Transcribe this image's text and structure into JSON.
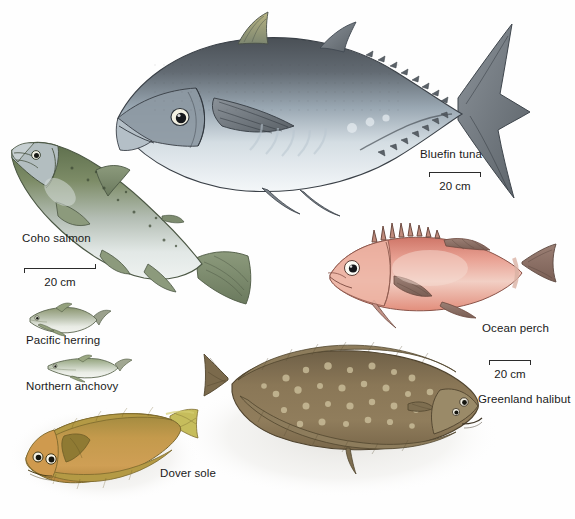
{
  "plate": {
    "title": "Marine fish species illustration plate",
    "background_color": "#fefefe",
    "width": 575,
    "height": 519
  },
  "species": [
    {
      "id": "bluefin-tuna",
      "label": "Bluefin tuna",
      "body_form": "fusiform",
      "colors": {
        "dorsal": "#5c6168",
        "mid": "#9aa7b2",
        "ventral": "#eef2f5",
        "fin": "#7d858c",
        "accent": "#c8b46a"
      },
      "label_position": {
        "left": 420,
        "top": 148
      }
    },
    {
      "id": "coho-salmon",
      "label": "Coho salmon",
      "body_form": "streamlined",
      "colors": {
        "dorsal": "#6e7d58",
        "mid": "#a9b6ae",
        "ventral": "#e9eeee",
        "fin": "#7e8c72",
        "accent": "#4d5a44"
      },
      "label_position": {
        "left": 22,
        "top": 232
      }
    },
    {
      "id": "pacific-herring",
      "label": "Pacific herring",
      "body_form": "small-forage",
      "colors": {
        "dorsal": "#8d9677",
        "mid": "#c6ccc2",
        "ventral": "#f0f2ee",
        "fin": "#9aa08c",
        "accent": "#5f6a52"
      },
      "label_position": {
        "left": 26,
        "top": 334
      }
    },
    {
      "id": "northern-anchovy",
      "label": "Northern anchovy",
      "body_form": "small-forage",
      "colors": {
        "dorsal": "#93a37c",
        "mid": "#cdd4c8",
        "ventral": "#f2f4f0",
        "fin": "#a1a792",
        "accent": "#64704f"
      },
      "label_position": {
        "left": 26,
        "top": 380
      }
    },
    {
      "id": "ocean-perch",
      "label": "Ocean perch",
      "body_form": "deep-bodied",
      "colors": {
        "dorsal": "#d07a6d",
        "mid": "#e8a79b",
        "ventral": "#f4ddd4",
        "fin": "#8d7268",
        "accent": "#b4564a"
      },
      "label_position": {
        "left": 482,
        "top": 322
      }
    },
    {
      "id": "greenland-halibut",
      "label": "Greenland halibut",
      "body_form": "flatfish",
      "colors": {
        "dorsal": "#7d6a4b",
        "mid": "#8e7a58",
        "ventral": "#a9956f",
        "fin": "#6d5c41",
        "accent": "#cfc19c"
      },
      "label_position": {
        "left": 478,
        "top": 393
      }
    },
    {
      "id": "dover-sole",
      "label": "Dover sole",
      "body_form": "flatfish",
      "colors": {
        "dorsal": "#9c8540",
        "mid": "#c59a4e",
        "ventral": "#d8b877",
        "fin": "#8a7438",
        "accent": "#c8c05e"
      },
      "label_position": {
        "left": 160,
        "top": 467
      }
    }
  ],
  "scale_bars": [
    {
      "id": "scale-tuna",
      "caption": "20 cm",
      "position": {
        "left": 429,
        "top": 172
      },
      "width": 52,
      "tick_style": "down-down"
    },
    {
      "id": "scale-salmon",
      "caption": "20 cm",
      "position": {
        "left": 24,
        "top": 268
      },
      "width": 72,
      "tick_style": "down-up"
    },
    {
      "id": "scale-halibut",
      "caption": "20 cm",
      "position": {
        "left": 489,
        "top": 360
      },
      "width": 42,
      "tick_style": "down-down"
    }
  ]
}
